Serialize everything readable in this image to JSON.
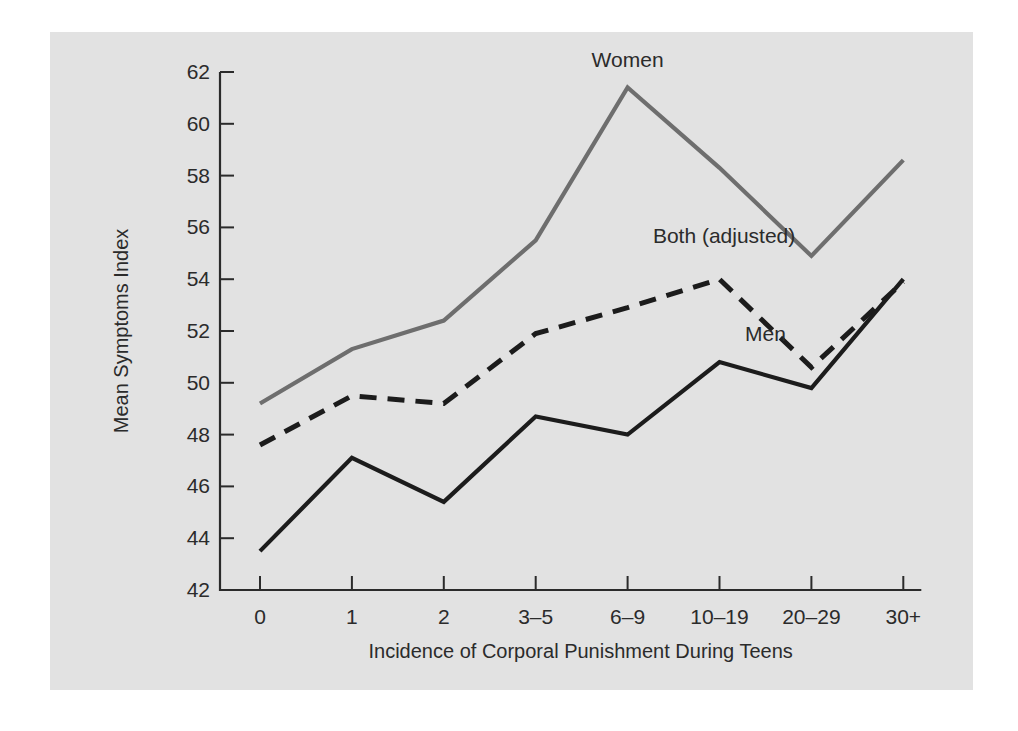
{
  "chart_data": {
    "type": "line",
    "title": "",
    "xlabel": "Incidence of Corporal Punishment During Teens",
    "ylabel": "Mean Symptoms Index",
    "categories": [
      "0",
      "1",
      "2",
      "3–5",
      "6–9",
      "10–19",
      "20–29",
      "30+"
    ],
    "ylim": [
      42,
      62
    ],
    "yticks": [
      "42",
      "44",
      "46",
      "48",
      "50",
      "52",
      "54",
      "56",
      "58",
      "60",
      "62"
    ],
    "grid": false,
    "legend_position": "inline-annotations",
    "series": [
      {
        "name": "Women",
        "style": "solid",
        "color": "#6e6e6e",
        "values": [
          49.2,
          51.3,
          52.4,
          55.5,
          61.4,
          58.3,
          54.9,
          58.6
        ]
      },
      {
        "name": "Both (adjusted)",
        "style": "dashed",
        "color": "#1c1c1c",
        "values": [
          47.6,
          49.5,
          49.2,
          51.9,
          52.9,
          54.0,
          50.6,
          53.9
        ]
      },
      {
        "name": "Men",
        "style": "solid",
        "color": "#1c1c1c",
        "values": [
          43.5,
          47.1,
          45.4,
          48.7,
          48.0,
          50.8,
          49.8,
          54.0
        ]
      }
    ],
    "annotations": [
      {
        "text": "Women",
        "x": 4,
        "y": 62.2
      },
      {
        "text": "Both (adjusted)",
        "x": 5.05,
        "y": 55.4
      },
      {
        "text": "Men",
        "x": 5.5,
        "y": 51.6
      }
    ]
  },
  "colors": {
    "panel_background": "#e2e2e2",
    "page_background": "#ffffff",
    "axis": "#2b2b2b",
    "women_line": "#6e6e6e",
    "men_line": "#1c1c1c",
    "both_line": "#1c1c1c"
  }
}
